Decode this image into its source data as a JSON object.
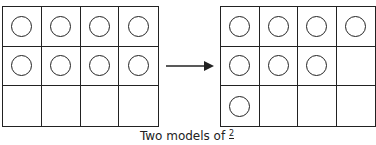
{
  "diagram": {
    "left_model": {
      "rows": 3,
      "cols": 4,
      "filled": [
        1,
        1,
        1,
        1,
        1,
        1,
        1,
        1,
        0,
        0,
        0,
        0
      ]
    },
    "right_model": {
      "rows": 3,
      "cols": 4,
      "filled": [
        1,
        1,
        1,
        1,
        1,
        1,
        1,
        0,
        1,
        0,
        0,
        0
      ]
    },
    "arrow": "right-arrow",
    "caption": {
      "text": "Two models of ",
      "fraction_numerator": "2"
    }
  }
}
